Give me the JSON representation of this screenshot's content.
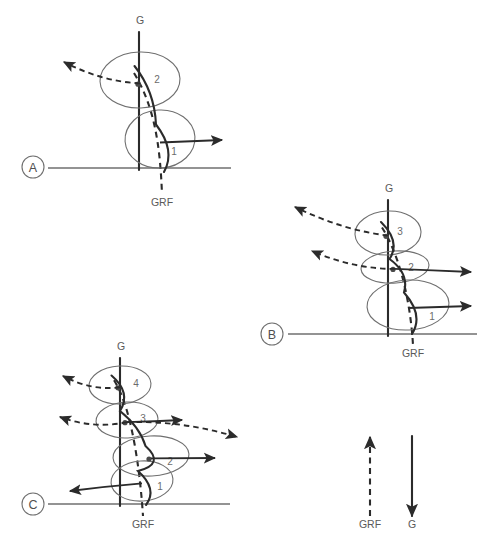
{
  "figure": {
    "width": 497,
    "height": 556,
    "background": "#ffffff",
    "stroke_dark": "#2b2b2b",
    "stroke_grey": "#6f6f6f",
    "text_color": "#5a5a5a"
  },
  "panels": [
    {
      "id": "A",
      "label": "A",
      "gravity_label": "G",
      "grf_label": "GRF",
      "segment_count": 2,
      "segment_labels": [
        "1",
        "2"
      ],
      "ground_line": {
        "x1": 48,
        "x2": 231,
        "y": 168
      },
      "panel_marker": {
        "cx": 33,
        "cy": 167,
        "r": 11
      },
      "gravity_axis": {
        "x": 139,
        "y_top": 32,
        "y_bottom": 170,
        "label_x": 140,
        "label_y": 24
      },
      "grf_axis": {
        "label_x": 162,
        "label_y": 206
      },
      "segments": [
        {
          "n": "1",
          "cx": 160,
          "cy": 139,
          "rx": 35,
          "ry": 29,
          "rotation": -4,
          "label_x": 174,
          "label_y": 155
        },
        {
          "n": "2",
          "cx": 140,
          "cy": 80,
          "rx": 40,
          "ry": 28,
          "rotation": -2,
          "label_x": 157,
          "label_y": 83
        }
      ],
      "arrows": [
        {
          "kind": "grf",
          "direction": "left",
          "tip_x": 64,
          "tip_y": 62
        },
        {
          "kind": "gravity",
          "direction": "right",
          "tip_x": 222,
          "tip_y": 140
        }
      ]
    },
    {
      "id": "B",
      "label": "B",
      "gravity_label": "G",
      "grf_label": "GRF",
      "segment_count": 3,
      "segment_labels": [
        "1",
        "2",
        "3"
      ],
      "ground_line": {
        "x1": 288,
        "x2": 477,
        "y": 334
      },
      "panel_marker": {
        "cx": 272,
        "cy": 334,
        "r": 11
      },
      "gravity_axis": {
        "x": 388,
        "y_top": 200,
        "y_bottom": 336,
        "label_x": 389,
        "label_y": 192
      },
      "grf_axis": {
        "label_x": 413,
        "label_y": 357
      },
      "segments": [
        {
          "n": "1",
          "cx": 408,
          "cy": 305,
          "rx": 41,
          "ry": 25,
          "rotation": -3,
          "label_x": 432,
          "label_y": 320
        },
        {
          "n": "2",
          "cx": 395,
          "cy": 267,
          "rx": 34,
          "ry": 16,
          "rotation": -4,
          "label_x": 411,
          "label_y": 271
        },
        {
          "n": "3",
          "cx": 388,
          "cy": 233,
          "rx": 33,
          "ry": 22,
          "rotation": -3,
          "label_x": 400,
          "label_y": 235
        }
      ],
      "arrows": [
        {
          "kind": "grf",
          "direction": "left",
          "tip_x": 295,
          "tip_y": 207
        },
        {
          "kind": "grf",
          "direction": "left",
          "tip_x": 312,
          "tip_y": 251
        },
        {
          "kind": "gravity",
          "direction": "right",
          "tip_x": 471,
          "tip_y": 272
        },
        {
          "kind": "gravity",
          "direction": "right",
          "tip_x": 471,
          "tip_y": 306
        }
      ]
    },
    {
      "id": "C",
      "label": "C",
      "gravity_label": "G",
      "grf_label": "GRF",
      "segment_count": 4,
      "segment_labels": [
        "1",
        "2",
        "3",
        "4"
      ],
      "ground_line": {
        "x1": 48,
        "x2": 230,
        "y": 504
      },
      "panel_marker": {
        "cx": 33,
        "cy": 504,
        "r": 11
      },
      "gravity_axis": {
        "x": 120,
        "y_top": 358,
        "y_bottom": 506,
        "label_x": 121,
        "label_y": 350
      },
      "grf_axis": {
        "label_x": 143,
        "label_y": 528
      },
      "segments": [
        {
          "n": "1",
          "cx": 142,
          "cy": 481,
          "rx": 31,
          "ry": 20,
          "rotation": -4,
          "label_x": 160,
          "label_y": 490
        },
        {
          "n": "2",
          "cx": 151,
          "cy": 456,
          "rx": 38,
          "ry": 20,
          "rotation": -3,
          "label_x": 170,
          "label_y": 465
        },
        {
          "n": "3",
          "cx": 127,
          "cy": 420,
          "rx": 31,
          "ry": 18,
          "rotation": -3,
          "label_x": 143,
          "label_y": 422
        },
        {
          "n": "4",
          "cx": 120,
          "cy": 385,
          "rx": 31,
          "ry": 19,
          "rotation": -3,
          "label_x": 136,
          "label_y": 387
        }
      ],
      "arrows": [
        {
          "kind": "grf",
          "direction": "left",
          "tip_x": 63,
          "tip_y": 376
        },
        {
          "kind": "grf",
          "direction": "left",
          "tip_x": 60,
          "tip_y": 417
        },
        {
          "kind": "grf",
          "direction": "right",
          "tip_x": 237,
          "tip_y": 437
        },
        {
          "kind": "gravity",
          "direction": "right",
          "tip_x": 182,
          "tip_y": 420
        },
        {
          "kind": "gravity",
          "direction": "right",
          "tip_x": 215,
          "tip_y": 458
        },
        {
          "kind": "gravity",
          "direction": "left",
          "tip_x": 70,
          "tip_y": 491
        }
      ]
    }
  ],
  "legend": {
    "items": [
      {
        "key": "grf",
        "label": "GRF",
        "style": "dashed",
        "direction": "up",
        "x": 370,
        "y_tail": 516,
        "y_tip": 437,
        "label_x": 370,
        "label_y": 528
      },
      {
        "key": "gravity",
        "label": "G",
        "style": "solid",
        "direction": "down",
        "x": 412,
        "y_tail": 436,
        "y_tip": 516,
        "label_x": 412,
        "label_y": 528
      }
    ]
  }
}
